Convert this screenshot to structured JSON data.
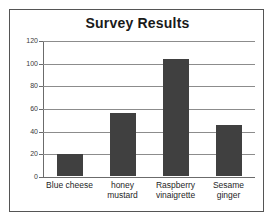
{
  "chart_data": {
    "type": "bar",
    "title": "Survey Results",
    "xlabel": "",
    "ylabel": "",
    "categories": [
      "Blue cheese",
      "honey mustard",
      "Raspberry vinaigrette",
      "Sesame ginger"
    ],
    "category_lines": [
      [
        "Blue cheese"
      ],
      [
        "honey",
        "mustard"
      ],
      [
        "Raspberry",
        "vinaigrette"
      ],
      [
        "Sesame",
        "ginger"
      ]
    ],
    "values": [
      19,
      56,
      103,
      45
    ],
    "ylim": [
      0,
      120
    ],
    "yticks": [
      0,
      20,
      40,
      60,
      80,
      100,
      120
    ],
    "ytick_labels": [
      "0",
      "20",
      "40",
      "60",
      "80",
      "100",
      "120"
    ],
    "grid": true,
    "grid_axis": "y",
    "legend": false,
    "bar_color": "#404040",
    "grid_color": "#8c8c8c",
    "axis_color": "#6b6b6b",
    "background_color": "#ffffff",
    "frame_color": "#555555",
    "title_color": "#1a1a1a"
  }
}
